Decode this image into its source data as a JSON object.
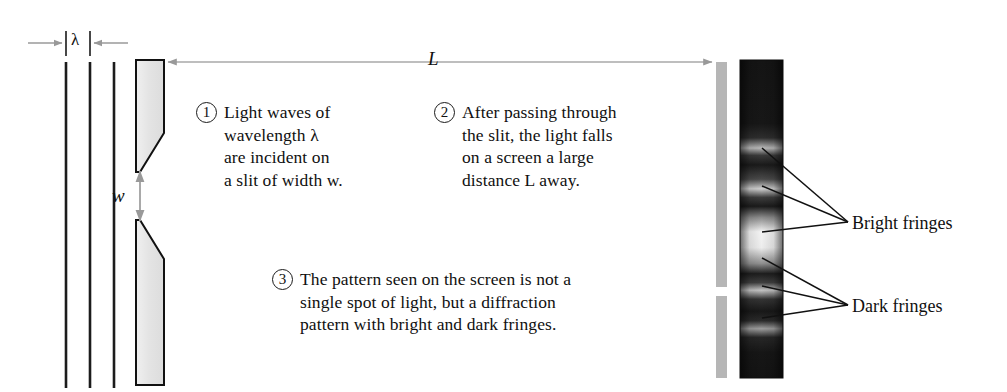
{
  "figure": {
    "background": "#ffffff"
  },
  "dimensions": {
    "wavelength_label": "λ",
    "distance_label": "L",
    "slit_width_label": "w"
  },
  "callouts": [
    {
      "number": "1",
      "text": "Light waves of\nwavelength λ\nare incident on\na slit of width w."
    },
    {
      "number": "2",
      "text": "After passing through\nthe slit, the light falls\non a screen a large\ndistance L away."
    },
    {
      "number": "3",
      "text": "The pattern seen on the screen is not a\nsingle spot of light, but a diffraction\npattern with bright and dark fringes."
    }
  ],
  "annotations": {
    "bright_fringes_label": "Bright fringes",
    "dark_fringes_label": "Dark fringes"
  },
  "colors": {
    "wavefront": "#1c1c1c",
    "slit_block_fill": "#e6e6e6",
    "slit_block_edge": "#111111",
    "screen_bar": "#b6b6b6",
    "dimension_arrow": "#999999",
    "leader_line": "#111111",
    "photo_dark": "#161616",
    "photo_bright": "#f2f2f2",
    "text": "#101010"
  },
  "photo": {
    "description": "single-slit diffraction photograph",
    "bright_fringe_positions": [
      148,
      186,
      232,
      268
    ],
    "dark_fringe_positions": [
      166,
      208,
      252,
      288,
      318
    ]
  }
}
